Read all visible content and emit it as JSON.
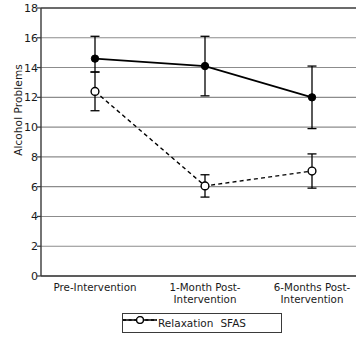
{
  "chart_data": {
    "type": "line",
    "title": "",
    "xlabel": "",
    "ylabel": "Alcohol Problems",
    "ylim": [
      0,
      18
    ],
    "ytick_step": 2,
    "yticks": [
      0,
      2,
      4,
      6,
      8,
      10,
      12,
      14,
      16,
      18
    ],
    "grid": "horizontal",
    "legend_position": "bottom-center",
    "categories": [
      "Pre-Intervention",
      "1-Month Post-\nIntervention",
      "6-Months Post-\nIntervention"
    ],
    "series": [
      {
        "name": "Relaxation",
        "values": [
          14.6,
          14.1,
          12.0
        ],
        "error_low": [
          13.7,
          12.1,
          9.9
        ],
        "error_high": [
          16.1,
          16.1,
          14.1
        ],
        "line_style": "solid",
        "marker": "filled-circle",
        "color": "#000000"
      },
      {
        "name": "SFAS",
        "values": [
          12.4,
          6.05,
          7.05
        ],
        "error_low": [
          11.1,
          5.3,
          5.9
        ],
        "error_high": [
          13.7,
          6.8,
          8.2
        ],
        "line_style": "dashed",
        "marker": "open-circle",
        "color": "#000000"
      }
    ]
  },
  "axis": {
    "ytick_labels": [
      "18",
      "16",
      "14",
      "12",
      "10",
      "8",
      "6",
      "4",
      "2",
      "0"
    ],
    "y_title": "Alcohol Problems"
  },
  "legend": {
    "entries": [
      {
        "label": "Relaxation"
      },
      {
        "label": "SFAS"
      }
    ]
  },
  "colors": {
    "axis": "#3a3a3a",
    "grid": "#8c8c8c",
    "series": "#000000",
    "background": "#ffffff"
  }
}
